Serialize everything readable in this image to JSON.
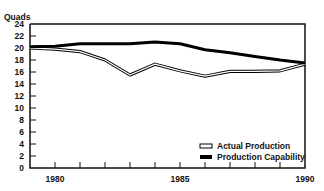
{
  "chart_data": {
    "type": "line",
    "title": "",
    "xlabel": "",
    "ylabel": "Quads",
    "xlim": [
      1979,
      1990
    ],
    "ylim": [
      0,
      24
    ],
    "x_ticks": [
      1980,
      1981,
      1982,
      1983,
      1984,
      1985,
      1986,
      1987,
      1988,
      1989,
      1990
    ],
    "x_tick_labels": [
      "1980",
      "1985",
      "1990"
    ],
    "y_ticks": [
      0,
      2,
      4,
      6,
      8,
      10,
      12,
      14,
      16,
      18,
      20,
      22,
      24
    ],
    "y_tick_labels": [
      "0",
      "2",
      "4",
      "6",
      "8",
      "10",
      "12",
      "14",
      "16",
      "18",
      "20",
      "22",
      "24"
    ],
    "grid": false,
    "legend_position": "lower right",
    "x": [
      1979,
      1980,
      1981,
      1982,
      1983,
      1984,
      1985,
      1986,
      1987,
      1988,
      1989,
      1990
    ],
    "series": [
      {
        "name": "Actual Production",
        "style": "outlined",
        "values": [
          20.0,
          19.8,
          19.4,
          18.0,
          15.5,
          17.3,
          16.2,
          15.3,
          16.1,
          16.1,
          16.2,
          17.3
        ]
      },
      {
        "name": "Production Capability",
        "style": "solid-bold",
        "values": [
          20.2,
          20.3,
          20.7,
          20.7,
          20.7,
          21.0,
          20.7,
          19.7,
          19.2,
          18.6,
          18.0,
          17.5
        ]
      }
    ]
  },
  "colors": {
    "axis": "#111111",
    "line": "#000000",
    "fill_inner": "#ffffff"
  }
}
